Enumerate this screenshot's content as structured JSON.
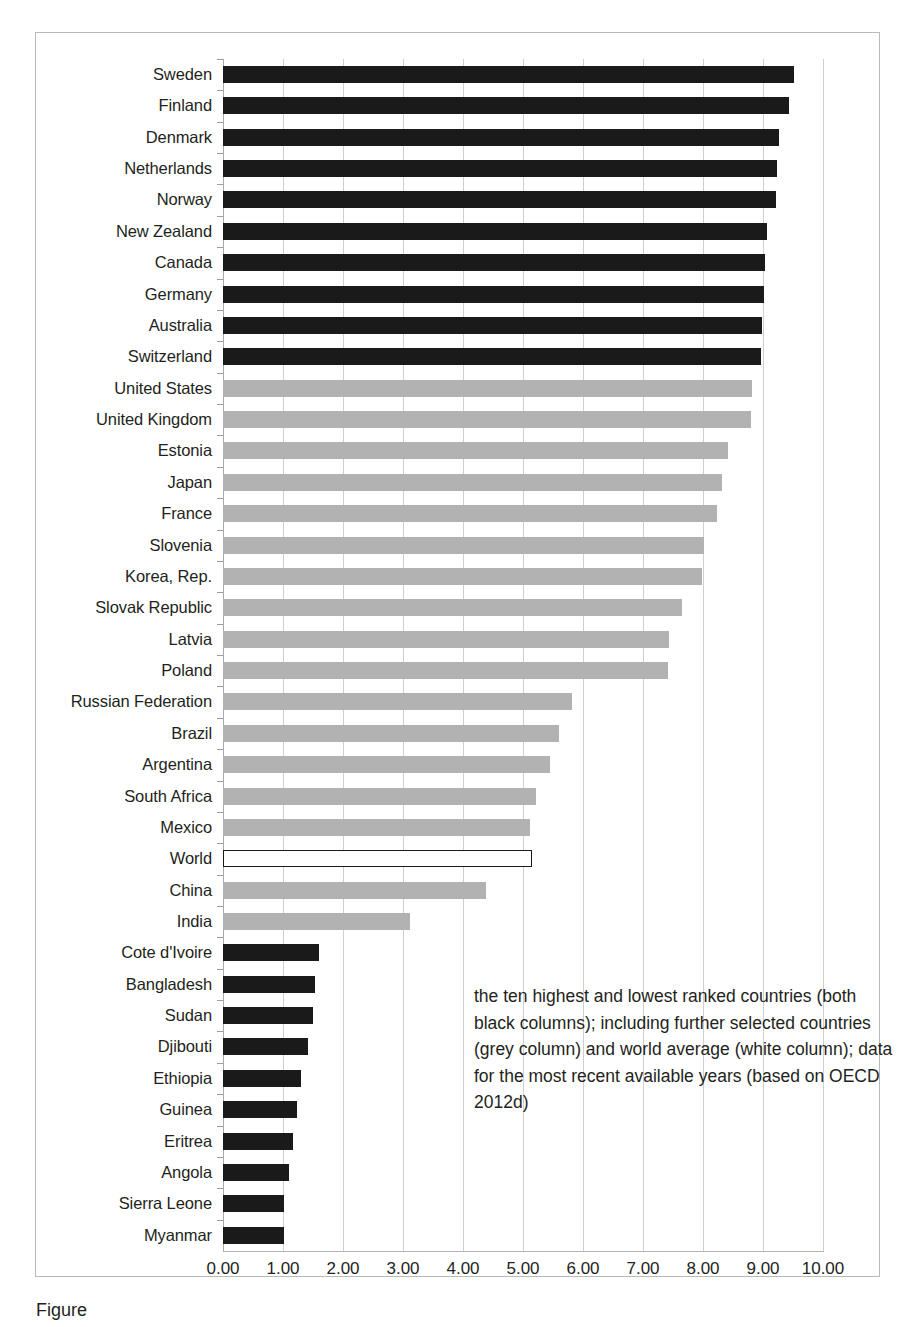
{
  "chart_data": {
    "type": "bar",
    "orientation": "horizontal",
    "title": "",
    "xlabel": "",
    "ylabel": "",
    "xlim": [
      0,
      10
    ],
    "grid": true,
    "legend": false,
    "xticks": [
      "0.00",
      "1.00",
      "2.00",
      "3.00",
      "4.00",
      "5.00",
      "6.00",
      "7.00",
      "8.00",
      "9.00",
      "10.00"
    ],
    "xtick_values": [
      0,
      1,
      2,
      3,
      4,
      5,
      6,
      7,
      8,
      9,
      10
    ],
    "categories": [
      "Sweden",
      "Finland",
      "Denmark",
      "Netherlands",
      "Norway",
      "New Zealand",
      "Canada",
      "Germany",
      "Australia",
      "Switzerland",
      "United States",
      "United Kingdom",
      "Estonia",
      "Japan",
      "France",
      "Slovenia",
      "Korea, Rep.",
      "Slovak Republic",
      "Latvia",
      "Poland",
      "Russian Federation",
      "Brazil",
      "Argentina",
      "South Africa",
      "Mexico",
      "World",
      "China",
      "India",
      "Cote d'Ivoire",
      "Bangladesh",
      "Sudan",
      "Djibouti",
      "Ethiopia",
      "Guinea",
      "Eritrea",
      "Angola",
      "Sierra Leone",
      "Myanmar"
    ],
    "values": [
      9.51,
      9.44,
      9.26,
      9.23,
      9.22,
      9.07,
      9.03,
      9.01,
      8.99,
      8.97,
      8.81,
      8.8,
      8.41,
      8.31,
      8.24,
      8.02,
      7.99,
      7.65,
      7.43,
      7.42,
      5.81,
      5.6,
      5.45,
      5.21,
      5.11,
      5.15,
      4.39,
      3.11,
      1.6,
      1.54,
      1.5,
      1.41,
      1.3,
      1.24,
      1.17,
      1.1,
      1.02,
      1.01
    ],
    "bar_styles": [
      "black",
      "black",
      "black",
      "black",
      "black",
      "black",
      "black",
      "black",
      "black",
      "black",
      "grey",
      "grey",
      "grey",
      "grey",
      "grey",
      "grey",
      "grey",
      "grey",
      "grey",
      "grey",
      "grey",
      "grey",
      "grey",
      "grey",
      "grey",
      "white",
      "grey",
      "grey",
      "black",
      "black",
      "black",
      "black",
      "black",
      "black",
      "black",
      "black",
      "black",
      "black"
    ],
    "series_colors": {
      "black": "#1a1a1a",
      "grey": "#b2b2b2",
      "white": "#ffffff"
    },
    "annotation": "the ten highest and lowest ranked countries (both black columns); including further selected countries (grey column) and world average (white column); data for the most recent available years (based on OECD 2012d)"
  },
  "figure": {
    "caption": "Figure"
  }
}
